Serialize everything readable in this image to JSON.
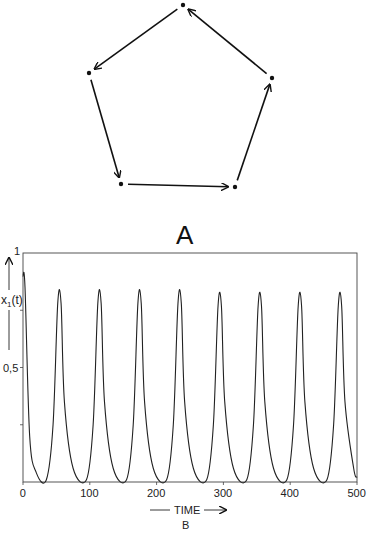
{
  "diagram": {
    "label": "A",
    "nodes": [
      {
        "id": 1,
        "x": 183,
        "y": 5
      },
      {
        "id": 2,
        "x": 89,
        "y": 73
      },
      {
        "id": 3,
        "x": 121,
        "y": 184
      },
      {
        "id": 4,
        "x": 235,
        "y": 187
      },
      {
        "id": 5,
        "x": 272,
        "y": 78
      }
    ],
    "edges": [
      [
        1,
        2
      ],
      [
        2,
        3
      ],
      [
        3,
        4
      ],
      [
        4,
        5
      ],
      [
        5,
        1
      ]
    ]
  },
  "chart_data": {
    "type": "line",
    "title": "",
    "caption": "B",
    "xlabel": "TIME",
    "ylabel": "x1(t)",
    "xlim": [
      0,
      500
    ],
    "ylim": [
      0,
      1
    ],
    "xticks": [
      "0",
      "100",
      "200",
      "300",
      "400",
      "500"
    ],
    "yticks": [
      "0,5",
      "1"
    ],
    "grid": false,
    "series": [
      {
        "name": "x1(t)",
        "x": [
          0,
          3,
          10,
          20,
          35,
          45,
          52,
          57,
          62,
          75,
          95,
          105,
          112,
          117,
          122,
          135,
          155,
          165,
          172,
          177,
          182,
          195,
          215,
          225,
          232,
          237,
          242,
          255,
          275,
          285,
          292,
          297,
          302,
          315,
          335,
          345,
          352,
          357,
          362,
          375,
          395,
          405,
          412,
          417,
          422,
          435,
          455,
          465,
          472,
          477,
          482,
          495,
          500
        ],
        "y": [
          0.9,
          0.85,
          0.2,
          0.04,
          0.01,
          0.25,
          0.78,
          0.78,
          0.35,
          0.06,
          0.01,
          0.25,
          0.78,
          0.78,
          0.35,
          0.06,
          0.01,
          0.25,
          0.78,
          0.78,
          0.35,
          0.06,
          0.01,
          0.25,
          0.78,
          0.78,
          0.35,
          0.06,
          0.01,
          0.25,
          0.77,
          0.77,
          0.35,
          0.06,
          0.01,
          0.25,
          0.77,
          0.77,
          0.35,
          0.06,
          0.01,
          0.25,
          0.77,
          0.77,
          0.35,
          0.06,
          0.01,
          0.25,
          0.77,
          0.77,
          0.35,
          0.06,
          0.02
        ]
      }
    ],
    "peaks_time": [
      52,
      111,
      175,
      236,
      296,
      357,
      417,
      478
    ],
    "peak_value": 0.78
  }
}
